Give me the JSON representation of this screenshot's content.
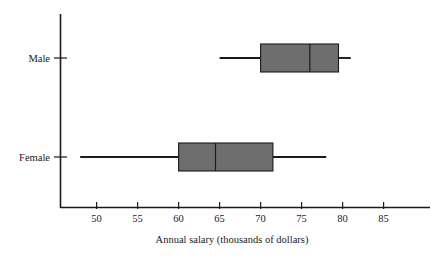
{
  "chart_data": {
    "type": "box",
    "title": "",
    "xlabel": "Annual salary (thousands of dollars)",
    "ylabel": "",
    "orientation": "horizontal",
    "xlim": [
      45.5,
      86.5
    ],
    "xticks": [
      50,
      55,
      60,
      65,
      70,
      75,
      80,
      85
    ],
    "xtick_labels": [
      "50",
      "55",
      "60",
      "65",
      "70",
      "75",
      "80",
      "85"
    ],
    "categories": [
      "Male",
      "Female"
    ],
    "grid": false,
    "legend": "none",
    "box_fill_color": "#6e6e6e",
    "box_edge_color": "#1a1a1a",
    "axis_color": "#1a1a1a",
    "boxes": [
      {
        "category": "Male",
        "whisker_low": 65.0,
        "q1": 70.0,
        "median": 76.0,
        "q3": 79.5,
        "whisker_high": 81.0
      },
      {
        "category": "Female",
        "whisker_low": 48.0,
        "q1": 60.0,
        "median": 64.5,
        "q3": 71.5,
        "whisker_high": 78.0
      }
    ]
  }
}
